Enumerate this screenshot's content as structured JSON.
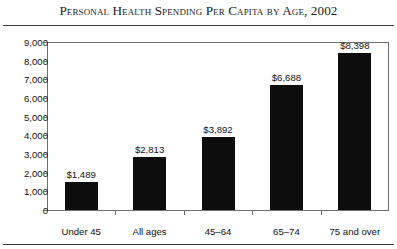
{
  "title": "Personal Health Spending Per Capita by Age, 2002",
  "chart_data": {
    "type": "bar",
    "title": "Personal Health Spending Per Capita by Age, 2002",
    "xlabel": "",
    "ylabel": "",
    "categories": [
      "Under 45",
      "All ages",
      "45–64",
      "65–74",
      "75 and over"
    ],
    "values": [
      1489,
      2813,
      3892,
      6688,
      8398
    ],
    "value_labels": [
      "$1,489",
      "$2,813",
      "$3,892",
      "$6,688",
      "$8,398"
    ],
    "ylim": [
      0,
      9000
    ],
    "ytick_values": [
      0,
      1000,
      2000,
      3000,
      4000,
      5000,
      6000,
      7000,
      8000,
      9000
    ],
    "ytick_labels": [
      "0",
      "1,000",
      "2,000",
      "3,000",
      "4,000",
      "5,000",
      "6,000",
      "7,000",
      "8,000",
      "9,000"
    ],
    "grid": false,
    "legend": null,
    "bar_color": "#0d0d0d",
    "frame_color": "#6e6e6e",
    "rule_color": "#3b3b3b"
  }
}
